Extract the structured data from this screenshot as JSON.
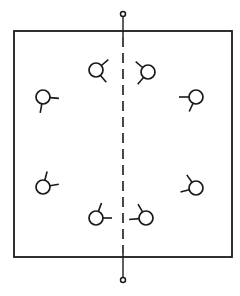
{
  "diagram": {
    "type": "schematic-symmetric-array",
    "width": 240,
    "height": 296,
    "stroke_color": "#1a1a1a",
    "background": "#ffffff",
    "box": {
      "x1": 14,
      "y1": 31,
      "x2": 232,
      "y2": 257
    },
    "axis": {
      "x": 123,
      "top_terminal": {
        "cx": 123,
        "cy": 14,
        "r": 2.5
      },
      "bottom_terminal": {
        "cx": 123,
        "cy": 280,
        "r": 2.5
      },
      "dash_pattern": "10,6"
    },
    "symbol_radius": 7,
    "symbols": [
      {
        "id": "top-left-inner",
        "cx": 96,
        "cy": 70,
        "sticks": [
          [
            -40,
            9
          ],
          [
            50,
            9
          ]
        ]
      },
      {
        "id": "top-right-inner",
        "cx": 148,
        "cy": 72,
        "sticks": [
          [
            -140,
            9
          ],
          [
            130,
            9
          ]
        ]
      },
      {
        "id": "left-upper",
        "cx": 43,
        "cy": 97,
        "sticks": [
          [
            5,
            9
          ],
          [
            100,
            9
          ]
        ]
      },
      {
        "id": "right-upper",
        "cx": 196,
        "cy": 97,
        "sticks": [
          [
            180,
            10
          ],
          [
            115,
            9
          ]
        ]
      },
      {
        "id": "left-lower",
        "cx": 43,
        "cy": 187,
        "sticks": [
          [
            -75,
            9
          ],
          [
            -10,
            9
          ]
        ]
      },
      {
        "id": "right-lower",
        "cx": 196,
        "cy": 188,
        "sticks": [
          [
            -125,
            9
          ],
          [
            165,
            9
          ]
        ]
      },
      {
        "id": "bottom-left-inner",
        "cx": 96,
        "cy": 218,
        "sticks": [
          [
            -70,
            9
          ],
          [
            0,
            9
          ]
        ]
      },
      {
        "id": "bottom-right-inner",
        "cx": 146,
        "cy": 218,
        "sticks": [
          [
            -120,
            9
          ],
          [
            175,
            10
          ]
        ]
      }
    ]
  }
}
